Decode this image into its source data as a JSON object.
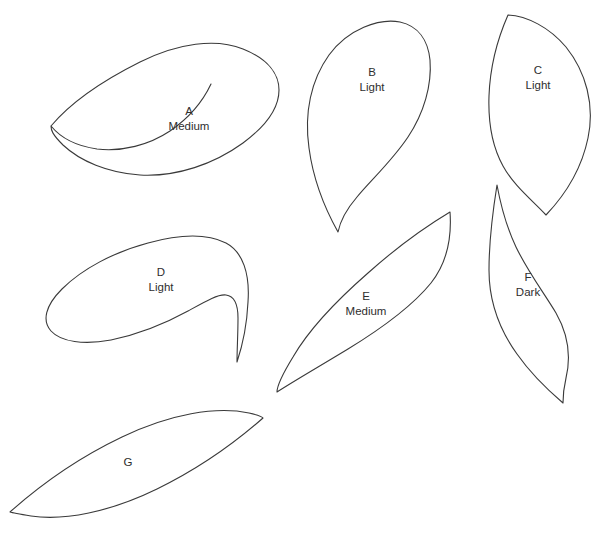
{
  "sheet": {
    "background_color": "#ffffff",
    "stroke_color": "#3a3a3a",
    "text_color": "#2e2e2e",
    "width": 603,
    "height": 535,
    "cropped_header_text": ""
  },
  "pieces": [
    {
      "id": "A",
      "letter": "A",
      "fabric": "Medium",
      "label_x": 189,
      "label_y": 115,
      "fabric_x": 189,
      "fabric_y": 130,
      "path": "M 51 126 C 72 101 104 80 140 62 C 178 43 216 38 243 49 C 268 59 279 74 279 90 C 279 108 266 126 243 143 C 214 164 177 177 140 175 C 108 173 80 161 63 145 C 52 134 51 130 51 126 Z M 51 126 C 60 137 76 146 97 149 C 122 152 149 145 170 131 C 189 118 203 101 211 84"
    },
    {
      "id": "B",
      "letter": "B",
      "fabric": "Light",
      "label_x": 372,
      "label_y": 76,
      "fabric_x": 372,
      "fabric_y": 91,
      "path": "M 338 232 C 324 207 313 178 309 148 C 304 113 311 80 329 55 C 348 29 379 18 400 22 C 418 26 428 40 430 60 C 432 85 424 113 408 137 C 392 161 371 180 357 197 C 345 211 340 222 338 232 Z"
    },
    {
      "id": "C",
      "letter": "C",
      "fabric": "Light",
      "label_x": 538,
      "label_y": 74,
      "fabric_x": 538,
      "fabric_y": 89,
      "path": "M 508 15 C 497 40 490 68 489 96 C 488 124 493 148 503 166 C 514 186 532 200 546 215 C 566 194 582 167 588 138 C 595 105 586 72 566 47 C 549 27 527 16 508 15 Z"
    },
    {
      "id": "D",
      "letter": "D",
      "fabric": "Light",
      "label_x": 161,
      "label_y": 276,
      "fabric_x": 161,
      "fabric_y": 291,
      "path": "M 237 362 C 243 344 247 323 248 302 C 250 274 243 252 226 243 C 206 233 177 235 148 243 C 114 252 82 269 62 289 C 45 306 42 321 51 331 C 61 342 84 345 111 340 C 140 334 168 322 188 311 C 206 301 218 294 226 295 C 234 296 238 304 238 318 C 238 334 237 350 237 362 Z"
    },
    {
      "id": "E",
      "letter": "E",
      "fabric": "Medium",
      "label_x": 366,
      "label_y": 300,
      "fabric_x": 366,
      "fabric_y": 315,
      "path": "M 450 212 C 425 227 396 248 368 273 C 336 301 308 331 293 357 C 282 375 277 387 277 392 C 294 381 320 366 348 349 C 384 327 414 304 431 283 C 446 264 452 240 450 212 Z"
    },
    {
      "id": "F",
      "letter": "F",
      "fabric": "Dark",
      "label_x": 528,
      "label_y": 281,
      "fabric_x": 528,
      "fabric_y": 296,
      "path": "M 497 185 C 501 207 507 228 516 247 C 528 272 544 293 556 313 C 568 334 571 357 566 378 C 563 391 563 398 563 403 C 549 391 531 374 517 354 C 499 329 489 300 489 270 C 489 240 493 210 497 185 Z"
    },
    {
      "id": "G",
      "letter": "G",
      "fabric": "",
      "label_x": 128,
      "label_y": 466,
      "fabric_x": 128,
      "fabric_y": 481,
      "path": "M 10 512 C 38 487 78 458 122 437 C 170 414 216 406 249 413 C 258 415 262 416 263 418 C 238 440 200 468 157 489 C 110 512 64 521 31 516 C 19 514 13 513 10 512 Z"
    }
  ]
}
